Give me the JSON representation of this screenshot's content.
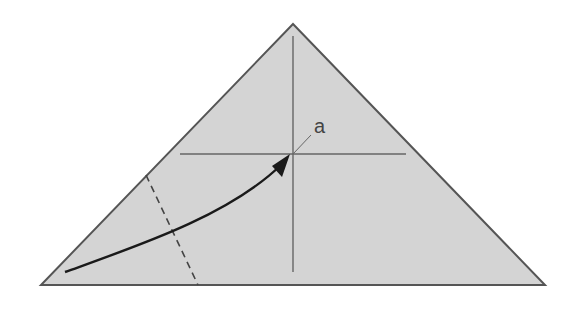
{
  "diagram": {
    "type": "origami-fold-step",
    "colors": {
      "background": "#ffffff",
      "paper_fill": "#d4d4d4",
      "edge_stroke": "#555555",
      "crease_stroke": "#666666",
      "arrow_stroke": "#1a1a1a"
    },
    "triangle": {
      "apex": [
        293,
        24
      ],
      "left": [
        41,
        285
      ],
      "right": [
        545,
        285
      ]
    },
    "creases": {
      "vertical": {
        "x": 293,
        "y1": 36,
        "y2": 272
      },
      "horizontal": {
        "y": 154,
        "x1": 180,
        "x2": 406
      },
      "valley_fold_dashed": {
        "x1": 146,
        "y1": 175,
        "x2": 198,
        "y2": 285
      }
    },
    "point_marker": {
      "label": "a",
      "leader_from": [
        293,
        154
      ],
      "leader_to": [
        310,
        135
      ]
    },
    "fold_arrow": {
      "from": [
        65,
        272
      ],
      "to": [
        288,
        158
      ]
    }
  }
}
